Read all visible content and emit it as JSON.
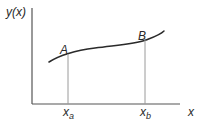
{
  "diagram": {
    "type": "function-curve-with-marked-points",
    "y_axis_label": "y(x)",
    "x_axis_label": "x",
    "points": [
      {
        "name": "A",
        "label": "A",
        "x_label_base": "x",
        "x_label_sub": "a"
      },
      {
        "name": "B",
        "label": "B",
        "x_label_base": "x",
        "x_label_sub": "b"
      }
    ],
    "colors": {
      "axis": "#555555",
      "curve": "#2a2a2a",
      "drop_line": "#9a9a9a",
      "text": "#2a2a2a",
      "background": "#ffffff"
    }
  }
}
